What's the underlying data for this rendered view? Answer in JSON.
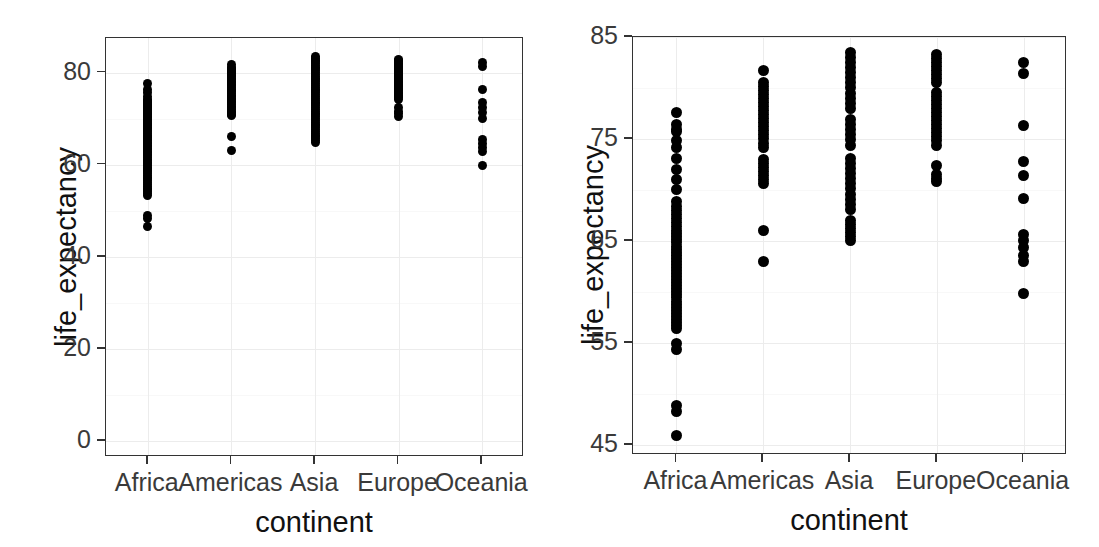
{
  "figure": {
    "background": "#ffffff",
    "point_color": "#000000",
    "axis_color": "#333333",
    "grid_color": "#ececec"
  },
  "chart_data": [
    {
      "panel": "left",
      "type": "scatter",
      "title": "",
      "xlabel": "continent",
      "ylabel": "life_expectancy",
      "categories": [
        "Africa",
        "Americas",
        "Asia",
        "Europe",
        "Oceania"
      ],
      "xticklabels": [
        "Africa",
        "Americas",
        "Asia",
        "Europe",
        "Oceania"
      ],
      "yticklabels": [
        "0",
        "20",
        "40",
        "60",
        "80"
      ],
      "yticks": [
        0,
        20,
        40,
        60,
        80
      ],
      "ylim": [
        -3.5,
        87.5
      ],
      "grid": true,
      "legend": "none",
      "series": [
        {
          "name": "Africa",
          "values": [
            77.6,
            76.4,
            75.7,
            74.8,
            74.2,
            73.9,
            73.6,
            73.4,
            73.1,
            72.8,
            72.5,
            72.3,
            72.0,
            71.8,
            71.6,
            71.3,
            71.0,
            70.8,
            70.5,
            70.2,
            69.9,
            69.6,
            69.3,
            69.0,
            68.7,
            68.4,
            68.1,
            67.8,
            67.4,
            67.1,
            66.8,
            66.4,
            66.1,
            65.8,
            65.5,
            65.2,
            64.9,
            64.6,
            64.2,
            63.9,
            63.6,
            63.2,
            62.9,
            62.6,
            62.2,
            61.9,
            61.6,
            61.2,
            60.9,
            60.5,
            60.2,
            59.8,
            59.4,
            59.1,
            58.7,
            58.4,
            58.0,
            57.6,
            57.2,
            56.9,
            56.5,
            56.1,
            55.7,
            55.3,
            54.9,
            54.5,
            54.1,
            53.7,
            53.3,
            48.9,
            48.3,
            46.5
          ]
        },
        {
          "name": "Americas",
          "values": [
            81.7,
            81.2,
            80.9,
            80.6,
            80.3,
            80.0,
            79.7,
            79.4,
            79.1,
            78.7,
            78.4,
            78.1,
            77.8,
            77.4,
            77.1,
            76.8,
            76.4,
            76.1,
            75.8,
            75.4,
            75.1,
            74.8,
            74.4,
            74.1,
            73.7,
            73.4,
            73.0,
            72.7,
            72.3,
            72.0,
            71.6,
            71.3,
            70.9,
            70.6,
            66.0,
            63.0
          ]
        },
        {
          "name": "Asia",
          "values": [
            83.5,
            83.1,
            82.7,
            82.4,
            82.0,
            81.6,
            81.2,
            80.8,
            80.4,
            80.0,
            79.6,
            79.2,
            78.8,
            78.4,
            78.0,
            77.6,
            77.2,
            76.8,
            76.4,
            76.0,
            75.6,
            75.2,
            74.8,
            74.4,
            74.0,
            73.6,
            73.2,
            72.8,
            72.4,
            72.0,
            71.6,
            71.2,
            70.8,
            70.4,
            70.0,
            69.6,
            69.2,
            68.8,
            68.4,
            68.0,
            67.6,
            67.2,
            66.8,
            66.4,
            66.0,
            65.6,
            65.2,
            64.8
          ]
        },
        {
          "name": "Europe",
          "values": [
            82.9,
            82.6,
            82.3,
            82.0,
            81.7,
            81.4,
            81.1,
            80.8,
            80.5,
            80.2,
            79.9,
            79.6,
            79.3,
            79.0,
            78.7,
            78.4,
            78.1,
            77.8,
            77.5,
            77.2,
            76.9,
            76.6,
            76.3,
            76.0,
            75.7,
            75.4,
            75.1,
            74.8,
            74.5,
            74.2,
            72.5,
            71.6,
            71.0,
            70.5
          ]
        },
        {
          "name": "Oceania",
          "values": [
            82.2,
            81.4,
            76.3,
            73.6,
            72.5,
            71.4,
            70.0,
            65.5,
            64.5,
            63.8,
            62.8,
            59.9
          ]
        }
      ]
    },
    {
      "panel": "right",
      "type": "scatter",
      "title": "",
      "xlabel": "continent",
      "ylabel": "life_expectancy",
      "categories": [
        "Africa",
        "Americas",
        "Asia",
        "Europe",
        "Oceania"
      ],
      "xticklabels": [
        "Africa",
        "Americas",
        "Asia",
        "Europe",
        "Oceania"
      ],
      "yticklabels": [
        "45",
        "55",
        "65",
        "75",
        "85"
      ],
      "yticks": [
        45,
        55,
        65,
        75,
        85
      ],
      "ylim": [
        44.0,
        85.0
      ],
      "grid": true,
      "legend": "none",
      "series": [
        {
          "name": "Africa",
          "values": [
            77.6,
            76.4,
            75.9,
            75.7,
            74.8,
            74.2,
            73.1,
            72.0,
            71.0,
            70.0,
            68.9,
            68.4,
            68.0,
            67.6,
            67.2,
            66.8,
            66.4,
            66.0,
            65.7,
            65.4,
            65.1,
            64.8,
            64.5,
            64.2,
            63.9,
            63.6,
            63.3,
            63.0,
            62.7,
            62.4,
            62.1,
            61.8,
            61.5,
            61.2,
            60.9,
            60.6,
            60.3,
            60.0,
            59.7,
            59.4,
            59.1,
            58.8,
            58.5,
            58.2,
            57.9,
            57.6,
            57.3,
            57.0,
            56.7,
            56.4,
            54.9,
            54.3,
            48.9,
            48.3,
            45.9
          ]
        },
        {
          "name": "Americas",
          "values": [
            81.7,
            80.5,
            80.1,
            79.8,
            79.4,
            79.0,
            78.6,
            78.2,
            77.8,
            77.4,
            77.0,
            76.6,
            76.2,
            75.8,
            75.4,
            75.0,
            74.6,
            74.2,
            73.0,
            72.6,
            72.2,
            71.8,
            71.4,
            71.0,
            70.6,
            66.0,
            63.0
          ]
        },
        {
          "name": "Asia",
          "values": [
            83.5,
            83.0,
            82.5,
            82.0,
            81.5,
            81.0,
            80.5,
            80.0,
            79.5,
            79.0,
            78.5,
            78.0,
            76.9,
            76.4,
            75.9,
            75.4,
            74.9,
            74.4,
            73.1,
            72.6,
            72.1,
            71.6,
            71.1,
            70.6,
            70.1,
            69.6,
            69.1,
            68.6,
            68.1,
            67.0,
            66.6,
            66.2,
            65.8,
            65.4,
            65.0
          ]
        },
        {
          "name": "Europe",
          "values": [
            83.3,
            82.9,
            82.5,
            82.1,
            81.7,
            81.3,
            80.9,
            80.5,
            79.6,
            79.2,
            78.8,
            78.4,
            78.0,
            77.6,
            77.2,
            76.8,
            76.4,
            76.0,
            75.6,
            75.2,
            74.8,
            74.4,
            72.4,
            71.5,
            71.1,
            70.8
          ]
        },
        {
          "name": "Oceania",
          "values": [
            82.5,
            81.4,
            76.3,
            72.8,
            71.4,
            69.2,
            65.6,
            65.0,
            64.4,
            63.6,
            63.0,
            59.8
          ]
        }
      ]
    }
  ]
}
